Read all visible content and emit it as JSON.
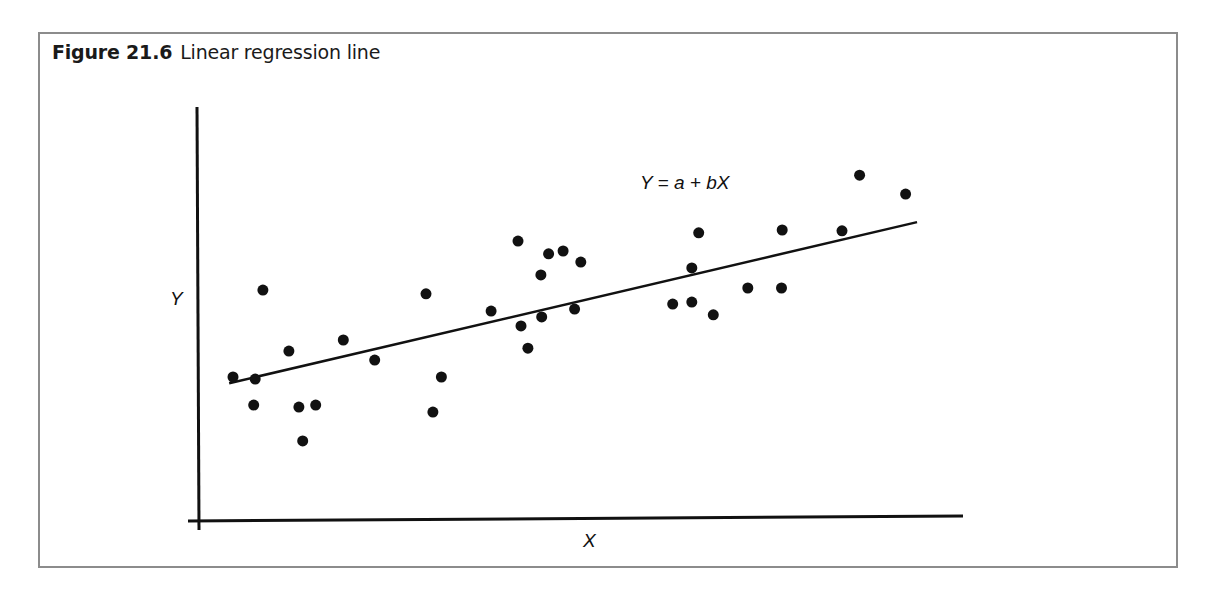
{
  "figure": {
    "number_label": "Figure 21.6",
    "caption": "Linear regression line"
  },
  "chart_data": {
    "type": "scatter",
    "xlabel": "X",
    "ylabel": "Y",
    "annotation": "Y = a + bX",
    "xlim": [
      0,
      100
    ],
    "ylim": [
      0,
      100
    ],
    "grid": false,
    "ticks": false,
    "legend": null,
    "points": [
      {
        "x": 4.7,
        "y": 34.7
      },
      {
        "x": 7.6,
        "y": 34.2
      },
      {
        "x": 7.4,
        "y": 27.9
      },
      {
        "x": 8.6,
        "y": 55.8
      },
      {
        "x": 12.0,
        "y": 41.0
      },
      {
        "x": 13.3,
        "y": 27.4
      },
      {
        "x": 13.8,
        "y": 19.2
      },
      {
        "x": 15.5,
        "y": 27.9
      },
      {
        "x": 19.1,
        "y": 43.7
      },
      {
        "x": 23.2,
        "y": 38.8
      },
      {
        "x": 29.9,
        "y": 54.9
      },
      {
        "x": 30.8,
        "y": 26.2
      },
      {
        "x": 31.9,
        "y": 34.7
      },
      {
        "x": 38.4,
        "y": 50.7
      },
      {
        "x": 41.9,
        "y": 67.7
      },
      {
        "x": 42.3,
        "y": 47.1
      },
      {
        "x": 43.2,
        "y": 41.7
      },
      {
        "x": 44.9,
        "y": 59.5
      },
      {
        "x": 45.0,
        "y": 49.3
      },
      {
        "x": 45.9,
        "y": 64.6
      },
      {
        "x": 47.8,
        "y": 65.3
      },
      {
        "x": 49.3,
        "y": 51.2
      },
      {
        "x": 50.1,
        "y": 62.6
      },
      {
        "x": 62.1,
        "y": 52.4
      },
      {
        "x": 64.6,
        "y": 52.9
      },
      {
        "x": 64.6,
        "y": 61.2
      },
      {
        "x": 65.5,
        "y": 69.7
      },
      {
        "x": 67.4,
        "y": 49.8
      },
      {
        "x": 71.9,
        "y": 56.3
      },
      {
        "x": 76.3,
        "y": 56.3
      },
      {
        "x": 76.4,
        "y": 70.4
      },
      {
        "x": 84.2,
        "y": 70.2
      },
      {
        "x": 86.5,
        "y": 83.7
      },
      {
        "x": 92.5,
        "y": 79.1
      }
    ],
    "regression_line": {
      "x0": 4.2,
      "y0": 33.2,
      "x1": 94.0,
      "y1": 72.3
    },
    "style": {
      "point_color": "#111111",
      "line_color": "#111111",
      "axis_color": "#111111",
      "frame_color": "#8c8c8c"
    }
  }
}
